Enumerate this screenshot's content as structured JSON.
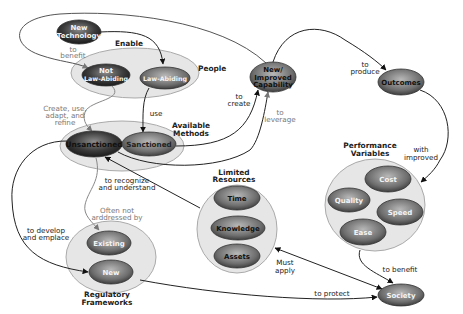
{
  "diagram": {
    "nodes": {
      "new_technology": {
        "line1": "New",
        "line2": "Technology"
      },
      "not_law_abiding": {
        "line1": "Not",
        "line2": "Law-Abiding"
      },
      "law_abiding": {
        "label": "Law-Abiding"
      },
      "unsanctioned": {
        "label": "Unsanctioned"
      },
      "sanctioned": {
        "label": "Sanctioned"
      },
      "new_improved_capability": {
        "line1": "New/",
        "line2": "Improved",
        "line3": "Capability"
      },
      "outcomes": {
        "label": "Outcomes"
      },
      "time": {
        "label": "Time"
      },
      "knowledge": {
        "label": "Knowledge"
      },
      "assets": {
        "label": "Assets"
      },
      "cost": {
        "label": "Cost"
      },
      "quality": {
        "label": "Quality"
      },
      "speed": {
        "label": "Speed"
      },
      "ease": {
        "label": "Ease"
      },
      "existing": {
        "label": "Existing"
      },
      "new_framework": {
        "label": "New"
      },
      "society": {
        "label": "Society"
      }
    },
    "groups": {
      "people": {
        "label": "People"
      },
      "available_methods": {
        "line1": "Available",
        "line2": "Methods"
      },
      "limited_resources": {
        "line1": "Limited",
        "line2": "Resources"
      },
      "performance_variables": {
        "line1": "Performance",
        "line2": "Variables"
      },
      "regulatory_frameworks": {
        "line1": "Regulatory",
        "line2": "Frameworks"
      }
    },
    "edges": {
      "enable": {
        "label": "Enable"
      },
      "to_benefit_top": {
        "line1": "to",
        "line2": "benefit"
      },
      "create_use": {
        "line1": "Create, use,",
        "line2": "adapt, and",
        "line3": "refine"
      },
      "use": {
        "label": "use"
      },
      "to_create": {
        "line1": "to",
        "line2": "create"
      },
      "to_leverage": {
        "line1": "to",
        "line2": "leverage"
      },
      "to_produce": {
        "line1": "to",
        "line2": "produce"
      },
      "with_improved": {
        "line1": "with",
        "line2": "improved"
      },
      "to_recognize": {
        "line1": "to recognize",
        "line2": "and understand"
      },
      "often_not": {
        "line1": "Often not",
        "line2": "arddressed by"
      },
      "to_develop": {
        "line1": "to develop",
        "line2": "and emplace"
      },
      "must_apply": {
        "line1": "Must",
        "line2": "apply"
      },
      "to_benefit_society": {
        "label": "to benefit"
      },
      "to_protect": {
        "label": "to protect"
      }
    }
  },
  "colors": {
    "node_dark": "#3a3a3a",
    "node_mid": "#7a7a7a",
    "group_fill": "#e6e6e6",
    "edge": "#222222",
    "edge_grey": "#888888"
  }
}
